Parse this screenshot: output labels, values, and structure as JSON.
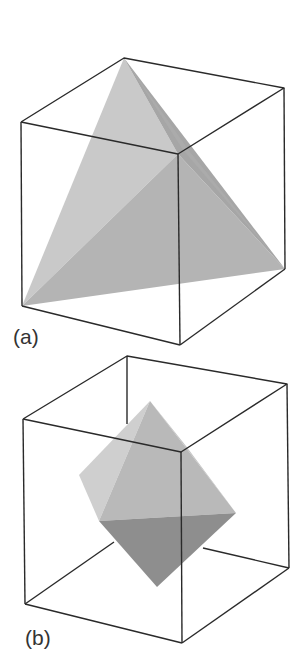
{
  "figures": [
    {
      "id": "a",
      "label": "(a)",
      "description": "Tetrahedron inscribed in a cube",
      "colors": {
        "face_left": "#c9c9c9",
        "face_front": "#b4b4b4",
        "face_right": "#a3a3a3",
        "edge": "#2a2a2a"
      }
    },
    {
      "id": "b",
      "label": "(b)",
      "description": "Octahedron inscribed in a cube",
      "colors": {
        "face_upper_left": "#cfcfcf",
        "face_upper_front": "#b9b9b9",
        "face_upper_right": "#c4c4c4",
        "face_lower": "#8e8e8e",
        "edge": "#2a2a2a"
      }
    }
  ]
}
